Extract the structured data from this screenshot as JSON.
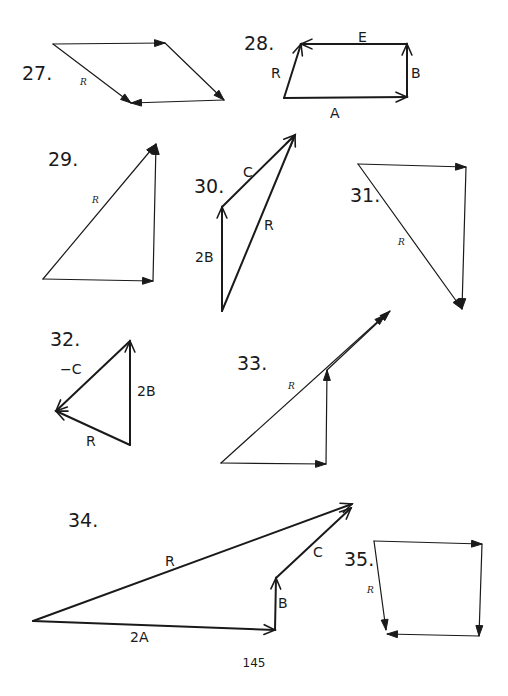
{
  "page": {
    "number": "145",
    "ink_color": "#1a1a1a",
    "background": "#ffffff"
  },
  "problems": [
    {
      "id": "27",
      "label": "27.",
      "label_pos": [
        22,
        80
      ],
      "label_size": 18,
      "vectors": [
        {
          "from": [
            53,
            44
          ],
          "to": [
            165,
            43
          ],
          "head": "fill",
          "width": 1.2
        },
        {
          "from": [
            165,
            43
          ],
          "to": [
            224,
            100
          ],
          "head": "fill",
          "width": 1.2
        },
        {
          "from": [
            224,
            100
          ],
          "to": [
            131,
            103
          ],
          "head": "fill",
          "width": 1.2
        },
        {
          "from": [
            53,
            44
          ],
          "to": [
            131,
            103
          ],
          "head": "fill",
          "width": 1.2,
          "resultant": true
        }
      ],
      "texts": [
        {
          "text": "R",
          "pos": [
            80,
            85
          ],
          "style": "it"
        }
      ]
    },
    {
      "id": "28",
      "label": "28.",
      "label_pos": [
        244,
        50
      ],
      "label_size": 18,
      "vectors": [
        {
          "from": [
            284,
            98
          ],
          "to": [
            407,
            97
          ],
          "head": "open",
          "width": 2
        },
        {
          "from": [
            407,
            97
          ],
          "to": [
            407,
            44
          ],
          "head": "open",
          "width": 2
        },
        {
          "from": [
            407,
            44
          ],
          "to": [
            301,
            44
          ],
          "head": "open",
          "width": 2
        },
        {
          "from": [
            284,
            98
          ],
          "to": [
            301,
            44
          ],
          "head": "open",
          "width": 2,
          "resultant": true
        }
      ],
      "texts": [
        {
          "text": "E",
          "pos": [
            358,
            42
          ],
          "style": "plain"
        },
        {
          "text": "B",
          "pos": [
            411,
            78
          ],
          "style": "plain"
        },
        {
          "text": "A",
          "pos": [
            330,
            118
          ],
          "style": "plain"
        },
        {
          "text": "R",
          "pos": [
            271,
            78
          ],
          "style": "plain"
        }
      ]
    },
    {
      "id": "29",
      "label": "29.",
      "label_pos": [
        48,
        166
      ],
      "label_size": 22,
      "vectors": [
        {
          "from": [
            43,
            279
          ],
          "to": [
            153,
            281
          ],
          "head": "fill",
          "width": 1.2
        },
        {
          "from": [
            153,
            281
          ],
          "to": [
            156,
            144
          ],
          "head": "fill",
          "width": 1.2
        },
        {
          "from": [
            43,
            279
          ],
          "to": [
            156,
            144
          ],
          "head": "fill",
          "width": 1.2,
          "resultant": true
        }
      ],
      "texts": [
        {
          "text": "R",
          "pos": [
            92,
            203
          ],
          "style": "it"
        }
      ]
    },
    {
      "id": "30",
      "label": "30.",
      "label_pos": [
        194,
        193
      ],
      "label_size": 19,
      "vectors": [
        {
          "from": [
            222,
            311
          ],
          "to": [
            222,
            207
          ],
          "head": "open",
          "width": 2
        },
        {
          "from": [
            222,
            207
          ],
          "to": [
            295,
            135
          ],
          "head": "open",
          "width": 2
        },
        {
          "from": [
            222,
            311
          ],
          "to": [
            295,
            135
          ],
          "head": "open",
          "width": 2,
          "resultant": true
        }
      ],
      "texts": [
        {
          "text": "C",
          "pos": [
            243,
            177
          ],
          "style": "plain"
        },
        {
          "text": "R",
          "pos": [
            264,
            230
          ],
          "style": "plain"
        },
        {
          "text": "2B",
          "pos": [
            195,
            262
          ],
          "style": "plain"
        }
      ]
    },
    {
      "id": "31",
      "label": "31.",
      "label_pos": [
        350,
        202
      ],
      "label_size": 19,
      "vectors": [
        {
          "from": [
            358,
            164
          ],
          "to": [
            466,
            167
          ],
          "head": "fill",
          "width": 1.2
        },
        {
          "from": [
            466,
            167
          ],
          "to": [
            462,
            309
          ],
          "head": "fill",
          "width": 1.2
        },
        {
          "from": [
            358,
            164
          ],
          "to": [
            462,
            309
          ],
          "head": "fill",
          "width": 1.2,
          "resultant": true
        }
      ],
      "texts": [
        {
          "text": "R",
          "pos": [
            398,
            245
          ],
          "style": "it"
        }
      ]
    },
    {
      "id": "32",
      "label": "32.",
      "label_pos": [
        50,
        346
      ],
      "label_size": 19,
      "vectors": [
        {
          "from": [
            130,
            445
          ],
          "to": [
            130,
            341
          ],
          "head": "open",
          "width": 2
        },
        {
          "from": [
            130,
            341
          ],
          "to": [
            56,
            411
          ],
          "head": "open",
          "width": 2
        },
        {
          "from": [
            130,
            445
          ],
          "to": [
            56,
            411
          ],
          "head": "open",
          "width": 2,
          "resultant": true
        }
      ],
      "texts": [
        {
          "text": "−C",
          "pos": [
            60,
            374
          ],
          "style": "plain"
        },
        {
          "text": "2B",
          "pos": [
            137,
            396
          ],
          "style": "plain"
        },
        {
          "text": "R",
          "pos": [
            86,
            446
          ],
          "style": "plain"
        }
      ]
    },
    {
      "id": "33",
      "label": "33.",
      "label_pos": [
        237,
        370
      ],
      "label_size": 19,
      "vectors": [
        {
          "from": [
            221,
            463
          ],
          "to": [
            326,
            464
          ],
          "head": "fill",
          "width": 1.2
        },
        {
          "from": [
            326,
            464
          ],
          "to": [
            327,
            370
          ],
          "head": "fill",
          "width": 1.2
        },
        {
          "from": [
            327,
            370
          ],
          "to": [
            390,
            311
          ],
          "head": "fill",
          "width": 1.2
        },
        {
          "from": [
            221,
            463
          ],
          "to": [
            385,
            315
          ],
          "head": "fill",
          "width": 1.2,
          "resultant": true
        }
      ],
      "texts": [
        {
          "text": "R",
          "pos": [
            288,
            389
          ],
          "style": "it"
        }
      ]
    },
    {
      "id": "34",
      "label": "34.",
      "label_pos": [
        68,
        527
      ],
      "label_size": 22,
      "vectors": [
        {
          "from": [
            33,
            621
          ],
          "to": [
            275,
            630
          ],
          "head": "open",
          "width": 2
        },
        {
          "from": [
            275,
            630
          ],
          "to": [
            276,
            578
          ],
          "head": "open",
          "width": 2
        },
        {
          "from": [
            276,
            578
          ],
          "to": [
            351,
            508
          ],
          "head": "open",
          "width": 2
        },
        {
          "from": [
            33,
            621
          ],
          "to": [
            352,
            504
          ],
          "head": "open",
          "width": 2,
          "resultant": true
        }
      ],
      "texts": [
        {
          "text": "R",
          "pos": [
            165,
            566
          ],
          "style": "plain"
        },
        {
          "text": "2A",
          "pos": [
            130,
            642
          ],
          "style": "plain"
        },
        {
          "text": "B",
          "pos": [
            278,
            608
          ],
          "style": "plain"
        },
        {
          "text": "C",
          "pos": [
            313,
            557
          ],
          "style": "plain"
        }
      ]
    },
    {
      "id": "35",
      "label": "35.",
      "label_pos": [
        344,
        566
      ],
      "label_size": 17,
      "vectors": [
        {
          "from": [
            374,
            541
          ],
          "to": [
            482,
            544
          ],
          "head": "fill",
          "width": 1.2
        },
        {
          "from": [
            482,
            544
          ],
          "to": [
            479,
            636
          ],
          "head": "fill",
          "width": 1.2
        },
        {
          "from": [
            479,
            636
          ],
          "to": [
            387,
            634
          ],
          "head": "fill",
          "width": 1.2
        },
        {
          "from": [
            374,
            541
          ],
          "to": [
            386,
            630
          ],
          "head": "fill",
          "width": 1.2,
          "resultant": true
        }
      ],
      "texts": [
        {
          "text": "R",
          "pos": [
            367,
            593
          ],
          "style": "it"
        }
      ]
    }
  ]
}
